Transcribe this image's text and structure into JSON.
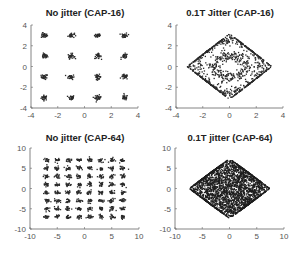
{
  "chart_data": [
    {
      "type": "scatter",
      "title": "No jitter (CAP-16)",
      "xlabel": "",
      "ylabel": "",
      "xlim": [
        -4,
        4
      ],
      "ylim": [
        -4,
        4
      ],
      "xticks": [
        -4,
        -2,
        0,
        2,
        4
      ],
      "yticks": [
        -4,
        -2,
        0,
        2,
        4
      ],
      "grid": false,
      "constellation": {
        "levels": [
          -3,
          -1,
          1,
          3
        ],
        "cluster_spread": 0.12,
        "points_per_symbol": 30
      },
      "jitter": 0,
      "color": "#2a2a2a"
    },
    {
      "type": "scatter",
      "title": "0.1T Jitter (CAP-16)",
      "xlabel": "",
      "ylabel": "",
      "xlim": [
        -4,
        4
      ],
      "ylim": [
        -4,
        4
      ],
      "xticks": [
        -4,
        -2,
        0,
        2,
        4
      ],
      "yticks": [
        -4,
        -2,
        0,
        2,
        4
      ],
      "grid": false,
      "constellation": {
        "levels": [
          -3,
          -1,
          1,
          3
        ],
        "cluster_spread": 0.12,
        "points_per_symbol": 70
      },
      "jitter": 0.1,
      "color": "#2a2a2a"
    },
    {
      "type": "scatter",
      "title": "No jitter (CAP-64)",
      "xlabel": "",
      "ylabel": "",
      "xlim": [
        -10,
        10
      ],
      "ylim": [
        -10,
        10
      ],
      "xticks": [
        -10,
        -5,
        0,
        5,
        10
      ],
      "yticks": [
        -10,
        -5,
        0,
        5,
        10
      ],
      "grid": false,
      "constellation": {
        "levels": [
          -7,
          -5,
          -3,
          -1,
          1,
          3,
          5,
          7
        ],
        "cluster_spread": 0.25,
        "points_per_symbol": 18
      },
      "jitter": 0,
      "color": "#2a2a2a"
    },
    {
      "type": "scatter",
      "title": "0.1T jitter (CAP-64)",
      "xlabel": "",
      "ylabel": "",
      "xlim": [
        -10,
        10
      ],
      "ylim": [
        -10,
        10
      ],
      "xticks": [
        -10,
        -5,
        0,
        5,
        10
      ],
      "yticks": [
        -10,
        -5,
        0,
        5,
        10
      ],
      "grid": false,
      "constellation": {
        "levels": [
          -7,
          -5,
          -3,
          -1,
          1,
          3,
          5,
          7
        ],
        "cluster_spread": 0.25,
        "points_per_symbol": 45
      },
      "jitter": 0.1,
      "color": "#1e1e1e"
    }
  ]
}
